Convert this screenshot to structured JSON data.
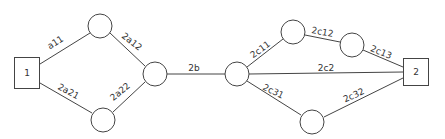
{
  "diagram": {
    "type": "network-graph",
    "terminals": [
      {
        "id": "t1",
        "label": "1",
        "x": 27,
        "y": 73,
        "w": 25,
        "h": 31
      },
      {
        "id": "t2",
        "label": "2",
        "x": 416,
        "y": 72,
        "w": 25,
        "h": 27
      }
    ],
    "nodes": [
      {
        "id": "n_a_top",
        "x": 100,
        "y": 26,
        "r": 12
      },
      {
        "id": "n_a_mid",
        "x": 155,
        "y": 74,
        "r": 12
      },
      {
        "id": "n_a_bot",
        "x": 103,
        "y": 120,
        "r": 12
      },
      {
        "id": "n_center",
        "x": 237,
        "y": 74,
        "r": 12
      },
      {
        "id": "n_c1",
        "x": 293,
        "y": 32,
        "r": 12
      },
      {
        "id": "n_c2",
        "x": 352,
        "y": 45,
        "r": 12
      },
      {
        "id": "n_c3",
        "x": 312,
        "y": 122,
        "r": 12
      }
    ],
    "edges": [
      {
        "from": "t1",
        "to": "n_a_top",
        "label": "a11",
        "x1": 40,
        "y1": 64,
        "x2": 90,
        "y2": 33,
        "lx": 57,
        "ly": 45,
        "angle": -32
      },
      {
        "from": "n_a_top",
        "to": "n_a_mid",
        "label": "2a12",
        "x1": 110,
        "y1": 33,
        "x2": 145,
        "y2": 66,
        "lx": 130,
        "ly": 44,
        "angle": 38
      },
      {
        "from": "t1",
        "to": "n_a_bot",
        "label": "2a21",
        "x1": 40,
        "y1": 83,
        "x2": 92,
        "y2": 113,
        "lx": 67,
        "ly": 94,
        "angle": 28
      },
      {
        "from": "n_a_bot",
        "to": "n_a_mid",
        "label": "2a22",
        "x1": 113,
        "y1": 112,
        "x2": 145,
        "y2": 82,
        "lx": 122,
        "ly": 94,
        "angle": -40
      },
      {
        "from": "n_a_mid",
        "to": "n_center",
        "label": "2b",
        "x1": 167,
        "y1": 74,
        "x2": 225,
        "y2": 74,
        "lx": 194,
        "ly": 71,
        "angle": 0
      },
      {
        "from": "n_center",
        "to": "n_c1",
        "label": "2c11",
        "x1": 247,
        "y1": 67,
        "x2": 283,
        "y2": 39,
        "lx": 262,
        "ly": 52,
        "angle": -36
      },
      {
        "from": "n_c1",
        "to": "n_c2",
        "label": "2c12",
        "x1": 305,
        "y1": 35,
        "x2": 340,
        "y2": 42,
        "lx": 322,
        "ly": 35,
        "angle": 10
      },
      {
        "from": "n_c2",
        "to": "t2",
        "label": "2c13",
        "x1": 363,
        "y1": 50,
        "x2": 403,
        "y2": 67,
        "lx": 380,
        "ly": 55,
        "angle": 22
      },
      {
        "from": "n_center",
        "to": "t2",
        "label": "2c2",
        "x1": 249,
        "y1": 74,
        "x2": 403,
        "y2": 72,
        "lx": 326,
        "ly": 71,
        "angle": 0
      },
      {
        "from": "n_center",
        "to": "n_c3",
        "label": "2c31",
        "x1": 247,
        "y1": 81,
        "x2": 301,
        "y2": 115,
        "lx": 272,
        "ly": 94,
        "angle": 26
      },
      {
        "from": "n_c3",
        "to": "t2",
        "label": "2c32",
        "x1": 324,
        "y1": 117,
        "x2": 403,
        "y2": 78,
        "lx": 355,
        "ly": 98,
        "angle": -24
      }
    ]
  }
}
